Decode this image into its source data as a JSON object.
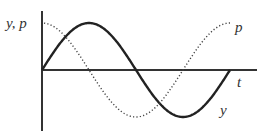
{
  "chart_data": {
    "type": "line",
    "title": "",
    "xlabel": "t",
    "ylabel": "y, p",
    "series": [
      {
        "name": "y",
        "style": "solid",
        "function": "sine",
        "x": [
          0,
          0.25,
          0.5,
          0.75,
          1.0
        ],
        "values": [
          0,
          1,
          0,
          -1,
          0
        ]
      },
      {
        "name": "p",
        "style": "dotted",
        "function": "cosine",
        "x": [
          0,
          0.25,
          0.5,
          0.75,
          1.0
        ],
        "values": [
          1,
          0,
          -1,
          0,
          1
        ]
      }
    ],
    "x_unit": "one period",
    "grid": false,
    "legend": "inline labels at curve ends"
  },
  "labels": {
    "y_axis": "y, p",
    "x_axis": "t",
    "curve_solid": "y",
    "curve_dotted": "p"
  },
  "colors": {
    "curve": "#222222",
    "axis": "#333333"
  }
}
